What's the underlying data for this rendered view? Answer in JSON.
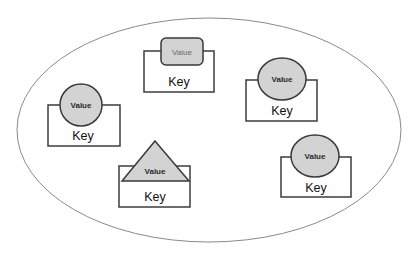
{
  "diagram": {
    "container": {
      "shape": "ellipse",
      "cx": 209,
      "cy": 130,
      "rx": 192,
      "ry": 112,
      "stroke": "#8a8a8a"
    },
    "colors": {
      "value_fill": "#d3d3d3",
      "value_stroke": "#3a3a3a",
      "box_stroke": "#3c3c3c"
    },
    "entries": [
      {
        "id": "top-center",
        "key": "Key",
        "value": "Value",
        "value_shape": "rounded-rectangle"
      },
      {
        "id": "left",
        "key": "Key",
        "value": "Value",
        "value_shape": "ellipse"
      },
      {
        "id": "right-top",
        "key": "Key",
        "value": "Value",
        "value_shape": "ellipse"
      },
      {
        "id": "bottom-center",
        "key": "Key",
        "value": "Value",
        "value_shape": "triangle"
      },
      {
        "id": "bottom-right",
        "key": "Key",
        "value": "Value",
        "value_shape": "ellipse"
      }
    ]
  }
}
